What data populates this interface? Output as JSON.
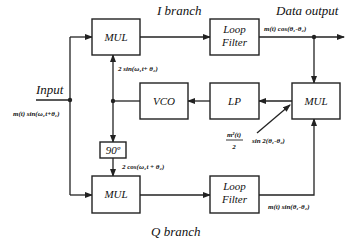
{
  "diagram": {
    "labels": {
      "i_branch": "I branch",
      "q_branch": "Q branch",
      "input": "Input",
      "data_output": "Data output"
    },
    "blocks": {
      "mul_top": "MUL",
      "loop_filter_top_line1": "Loop",
      "loop_filter_top_line2": "Filter",
      "vco": "VCO",
      "lp": "LP",
      "mul_right": "MUL",
      "phase_shift": "90º",
      "mul_bottom": "MUL",
      "loop_filter_bottom_line1": "Loop",
      "loop_filter_bottom_line2": "Filter"
    },
    "signals": {
      "input_signal": "m(t) sin(ω₁t+θ₁)",
      "vco_sin": "2 sin(ω₁t+ θ₂)",
      "vco_cos": "2 cos(ω₁t + θ₂)",
      "i_output": "m(t) cos(θ₁-θ₂)",
      "q_output": "m(t) sin(θ₁-θ₂)",
      "error_num": "m²(t)",
      "error_den": "2",
      "error_term": "sin 2(θ₁-θ₂)"
    }
  }
}
